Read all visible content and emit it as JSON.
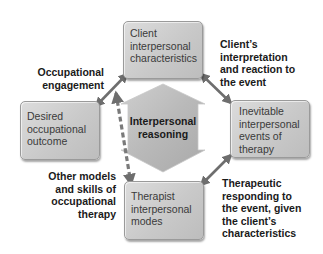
{
  "diagram": {
    "center": {
      "label": "Interpersonal\nreasoning"
    },
    "boxes": {
      "top": {
        "label": "Client\ninterpersonal\ncharacteristics"
      },
      "left": {
        "label": "Desired\noccupational\noutcome"
      },
      "right": {
        "label": "Inevitable\ninterpersonal\nevents of\ntherapy"
      },
      "bottom": {
        "label": "Therapist\ninterpersonal\nmodes"
      }
    },
    "edge_labels": {
      "top_left": "Occupational\nengagement",
      "top_right": "Client’s\ninterpretation\nand reaction to\nthe event",
      "bottom_left": "Other models\nand skills of\noccupational\ntherapy",
      "bottom_right": "Therapeutic\nresponding to\nthe event, given\nthe client’s\ncharacteristics"
    },
    "colors": {
      "box_fill": "#c9c9c9",
      "arrow": "#6e6e6e",
      "center_shape": "#b5b5b5"
    }
  }
}
